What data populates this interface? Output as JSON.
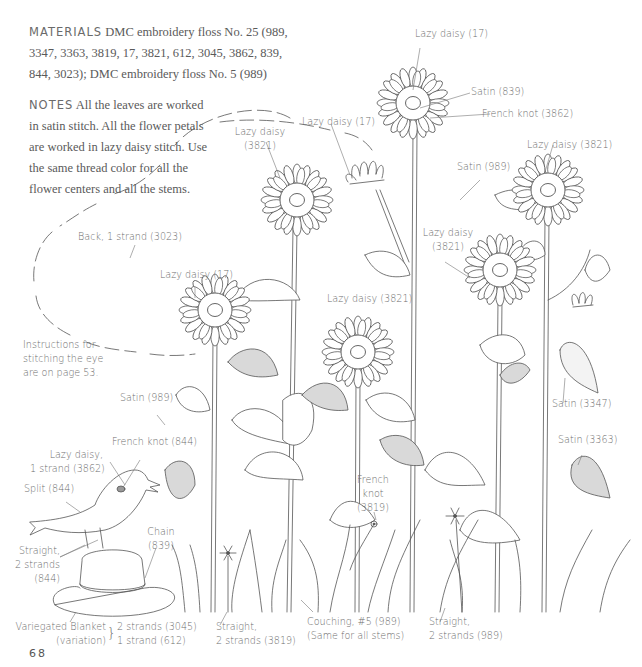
{
  "materials": {
    "heading": "MATERIALS",
    "line1": "DMC embroidery floss No. 25 (989,",
    "line2": "3347, 3363, 3819, 17, 3821, 612, 3045, 3862, 839,",
    "line3": "844, 3023); DMC embroidery floss No. 5 (989)"
  },
  "notes": {
    "heading": "NOTES",
    "line1": "All the leaves are worked",
    "line2": "in satin stitch. All the flower petals",
    "line3": "are worked in lazy daisy stitch. Use",
    "line4": "the same thread color for all the",
    "line5": "flower centers and all the stems."
  },
  "eye_note": {
    "line1": "Instructions for",
    "line2": "stitching the eye",
    "line3": "are on page 53."
  },
  "labels": {
    "top_flower_petals": "Lazy daisy (17)",
    "top_flower_satin": "Satin (839)",
    "top_flower_knot": "French knot (3862)",
    "bud_petals": "Lazy daisy (17)",
    "left_tall_flower_l1": "Lazy daisy",
    "left_tall_flower_l2": "(3821)",
    "right_tall_flower": "Lazy daisy (3821)",
    "satin_989_top": "Satin (989)",
    "back_stitch": "Back, 1 strand (3023)",
    "left_flower_petals": "Lazy daisy (17)",
    "center_flower_petals": "Lazy daisy (3821)",
    "right_mid_flower_l1": "Lazy daisy",
    "right_mid_flower_l2": "(3821)",
    "satin_989_left": "Satin (989)",
    "satin_3347": "Satin (3347)",
    "satin_3363": "Satin (3363)",
    "bird_knot": "French knot (844)",
    "bird_eye_l1": "Lazy daisy,",
    "bird_eye_l2": "1 strand (3862)",
    "bird_split": "Split (844)",
    "bird_legs_l1": "Straight,",
    "bird_legs_l2": "2 strands",
    "bird_legs_l3": "(844)",
    "hat_chain_l1": "Chain",
    "hat_chain_l2": "(839)",
    "french_knot_l1": "French",
    "french_knot_l2": "knot",
    "french_knot_l3": "(3819)",
    "blanket_l1": "Variegated Blanket",
    "blanket_l2": "(variation)",
    "blanket_strands_1": "2 strands (3045)",
    "blanket_strands_2": "1 strand (612)",
    "straight_3819_l1": "Straight,",
    "straight_3819_l2": "2 strands (3819)",
    "couching_l1": "Couching, #5 (989)",
    "couching_l2": "(Same for all stems)",
    "straight_989_l1": "Straight,",
    "straight_989_l2": "2 strands (989)"
  },
  "page_number": "68",
  "colors": {
    "line": "#555555",
    "leaf_fill": "#d9d9d9",
    "text": "#6e6e6e"
  }
}
